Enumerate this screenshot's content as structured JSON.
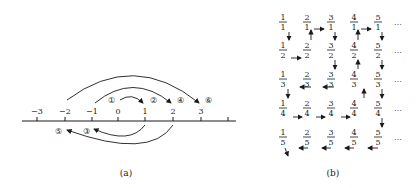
{
  "panel_a": {
    "caption": "(a)",
    "ticks": [
      {
        "label": "−3",
        "x": 37
      },
      {
        "label": "−2",
        "x": 65
      },
      {
        "label": "−1",
        "x": 92
      },
      {
        "label": "0",
        "x": 118
      },
      {
        "label": "1",
        "x": 145
      },
      {
        "label": "2",
        "x": 173
      },
      {
        "label": "3",
        "x": 201
      },
      {
        "label": "",
        "x": 228
      }
    ],
    "step_labels": [
      {
        "label": "①",
        "x": 111,
        "y": 100
      },
      {
        "label": "②",
        "x": 153,
        "y": 100
      },
      {
        "label": "③",
        "x": 86,
        "y": 131
      },
      {
        "label": "④",
        "x": 180,
        "y": 100
      },
      {
        "label": "⑤",
        "x": 58,
        "y": 131
      },
      {
        "label": "⑥",
        "x": 208,
        "y": 100
      }
    ]
  },
  "panel_b": {
    "caption": "(b)",
    "fractions": [
      [
        "1/1",
        "2/1",
        "3/1",
        "4/1",
        "5/1"
      ],
      [
        "1/2",
        "2/2",
        "3/2",
        "4/2",
        "5/2"
      ],
      [
        "1/3",
        "2/3",
        "3/3",
        "4/3",
        "5/3"
      ],
      [
        "1/4",
        "2/4",
        "3/4",
        "4/4",
        "5/4"
      ],
      [
        "1/5",
        "2/5",
        "3/5",
        "4/5",
        "5/5"
      ]
    ],
    "ellipsis": "…"
  }
}
